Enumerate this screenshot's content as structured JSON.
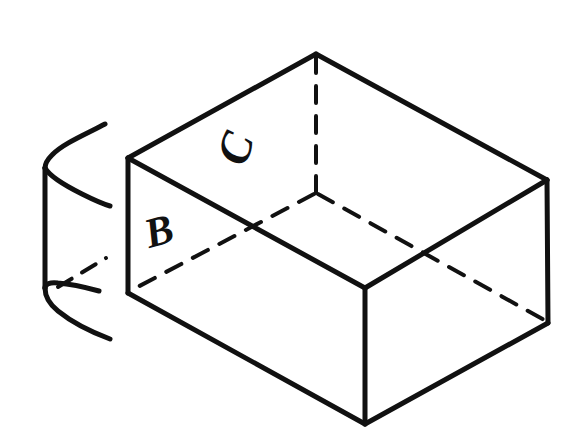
{
  "figure": {
    "background_color": "#ffffff",
    "ink_color": "#111111",
    "canvas": {
      "width": 581,
      "height": 447
    },
    "labels": [
      {
        "id": "face-c",
        "text": "C",
        "x": 240,
        "y": 150,
        "rotation": -72,
        "font_size": 46,
        "face": "top-back-inner-face"
      },
      {
        "id": "face-b",
        "text": "B",
        "x": 160,
        "y": 235,
        "rotation": -16,
        "font_size": 42,
        "face": "front-left-outer-face"
      }
    ],
    "parts": [
      {
        "id": "main-box",
        "name": "open-rectangular-box",
        "style": "solid-and-dashed-outline"
      },
      {
        "id": "side-fragment",
        "name": "detached-box-fragment",
        "style": "solid-and-dashed-outline"
      }
    ],
    "solid_edges": [
      {
        "id": "top-back-left",
        "from": [
          128,
          158
        ],
        "to": [
          316,
          54
        ]
      },
      {
        "id": "top-back-right",
        "from": [
          316,
          54
        ],
        "to": [
          547,
          180
        ]
      },
      {
        "id": "top-front-right",
        "from": [
          547,
          180
        ],
        "to": [
          365,
          288
        ]
      },
      {
        "id": "top-front-left",
        "from": [
          365,
          288
        ],
        "to": [
          128,
          158
        ]
      },
      {
        "id": "left-vertical",
        "from": [
          128,
          158
        ],
        "to": [
          128,
          293
        ]
      },
      {
        "id": "front-vertical",
        "from": [
          365,
          288
        ],
        "to": [
          365,
          424
        ]
      },
      {
        "id": "right-vertical",
        "from": [
          547,
          180
        ],
        "to": [
          548,
          323
        ]
      },
      {
        "id": "bottom-front-left",
        "from": [
          128,
          293
        ],
        "to": [
          365,
          424
        ]
      },
      {
        "id": "bottom-front-right",
        "from": [
          365,
          424
        ],
        "to": [
          548,
          323
        ]
      }
    ],
    "dashed_edges": [
      {
        "id": "hidden-back-vertical",
        "from": [
          316,
          54
        ],
        "to": [
          316,
          194
        ]
      },
      {
        "id": "hidden-floor-left",
        "from": [
          316,
          194
        ],
        "to": [
          128,
          293
        ]
      },
      {
        "id": "hidden-floor-right",
        "from": [
          316,
          194
        ],
        "to": [
          548,
          323
        ]
      }
    ],
    "fragment_solid_edges": [
      {
        "id": "frag-top-upper",
        "from": [
          48,
          160
        ],
        "to": [
          104,
          126
        ]
      },
      {
        "id": "frag-top-lower",
        "from": [
          48,
          168
        ],
        "to": [
          108,
          203
        ]
      },
      {
        "id": "frag-vertical",
        "from": [
          45,
          165
        ],
        "to": [
          45,
          293
        ]
      },
      {
        "id": "frag-bottom-upper",
        "from": [
          45,
          293
        ],
        "to": [
          100,
          290
        ]
      },
      {
        "id": "frag-bottom-lower",
        "from": [
          48,
          300
        ],
        "to": [
          108,
          334
        ]
      }
    ],
    "fragment_dashed_edges": [
      {
        "id": "frag-hidden-floor",
        "from": [
          60,
          285
        ],
        "to": [
          104,
          258
        ]
      }
    ]
  }
}
